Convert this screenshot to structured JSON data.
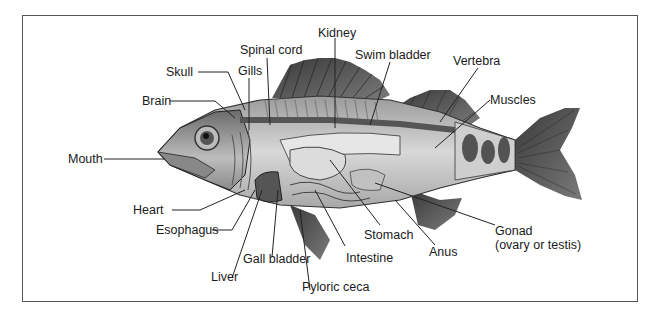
{
  "diagram": {
    "labels": {
      "kidney": "Kidney",
      "spinal_cord": "Spinal cord",
      "swim_bladder": "Swim bladder",
      "vertebra": "Vertebra",
      "skull": "Skull",
      "gills": "Gills",
      "brain": "Brain",
      "muscles": "Muscles",
      "mouth": "Mouth",
      "heart": "Heart",
      "esophagus": "Esophagus",
      "stomach": "Stomach",
      "gonad": "Gonad",
      "gonad_note": "(ovary or testis)",
      "anus": "Anus",
      "gall_bladder": "Gall bladder",
      "intestine": "Intestine",
      "liver": "Liver",
      "pyloric_ceca": "Pyloric ceca"
    }
  }
}
